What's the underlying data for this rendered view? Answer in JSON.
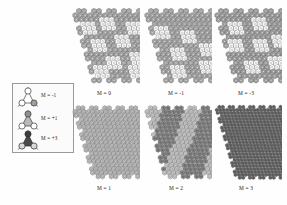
{
  "figure": {
    "background_color": "#fefefe"
  },
  "legend": {
    "name": "motif-legend",
    "border_color": "#9a9a9a",
    "items": [
      {
        "label": "M = -1",
        "icon": "open-trimer-icon",
        "fill": "#ffffff",
        "shade": "open"
      },
      {
        "label": "M = +1",
        "icon": "half-trimer-icon",
        "fill": "#b8b8b8",
        "shade": "half"
      },
      {
        "label": "M = +3",
        "icon": "solid-trimer-icon",
        "fill": "#4a4a4a",
        "shade": "solid"
      }
    ]
  },
  "panels": {
    "top_row": [
      {
        "id": "panel-top-1",
        "label": "M = 0",
        "matrix_fill": "#a8a8a8",
        "defect_fill": "#ffffff",
        "defect_count": 9,
        "density": "sparse-defects"
      },
      {
        "id": "panel-top-2",
        "label": "M = -1",
        "matrix_fill": "#a8a8a8",
        "defect_fill": "#ffffff",
        "defect_count": 6,
        "density": "sparse-defects"
      },
      {
        "id": "panel-top-3",
        "label": "M = -3",
        "matrix_fill": "#a0a0a0",
        "defect_fill": "#ffffff",
        "defect_count": 7,
        "density": "sparse-defects"
      }
    ],
    "bottom_row": [
      {
        "id": "panel-bot-1",
        "label": "M = 1",
        "matrix_fill": "#bdbdbd",
        "defect_fill": "#bdbdbd",
        "defect_count": 0,
        "density": "uniform-light"
      },
      {
        "id": "panel-bot-2",
        "label": "M = 2",
        "matrix_fill": "#8a8a8a",
        "defect_fill": "#c9c9c9",
        "defect_count": 0,
        "density": "striped-bands"
      },
      {
        "id": "panel-bot-3",
        "label": "M = 3",
        "matrix_fill": "#6e6e6e",
        "defect_fill": "#6e6e6e",
        "defect_count": 0,
        "density": "uniform-dark"
      }
    ]
  },
  "colors": {
    "outline": "#3a3a3a",
    "matrix_light": "#bdbdbd",
    "matrix_mid": "#a8a8a8",
    "matrix_dark": "#6e6e6e",
    "defect_white": "#ffffff"
  }
}
